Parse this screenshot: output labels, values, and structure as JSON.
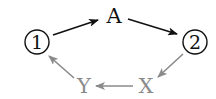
{
  "diagram": {
    "nodes": [
      {
        "id": "n1",
        "label": "1",
        "shape": "circle",
        "color": "#111111"
      },
      {
        "id": "nA",
        "label": "A",
        "shape": "text",
        "color": "#111111"
      },
      {
        "id": "n2",
        "label": "2",
        "shape": "circle",
        "color": "#111111"
      },
      {
        "id": "nX",
        "label": "X",
        "shape": "text",
        "color": "#8a8a8a"
      },
      {
        "id": "nY",
        "label": "Y",
        "shape": "text",
        "color": "#8a8a8a"
      }
    ],
    "edges": [
      {
        "from": "1",
        "to": "A",
        "color": "#111111"
      },
      {
        "from": "A",
        "to": "2",
        "color": "#111111"
      },
      {
        "from": "2",
        "to": "X",
        "color": "#8a8a8a"
      },
      {
        "from": "X",
        "to": "Y",
        "color": "#8a8a8a"
      },
      {
        "from": "Y",
        "to": "1",
        "color": "#8a8a8a"
      }
    ],
    "colors": {
      "dark": "#111111",
      "gray": "#8a8a8a"
    }
  }
}
